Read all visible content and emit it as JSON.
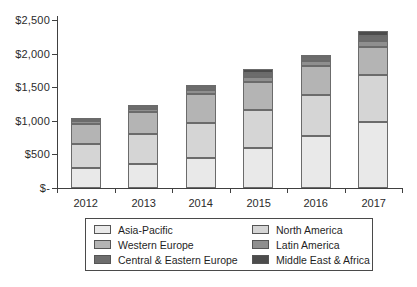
{
  "chart_data": {
    "type": "bar",
    "stacked": true,
    "title": "",
    "unit": "USD",
    "categories": [
      "2012",
      "2013",
      "2014",
      "2015",
      "2016",
      "2017"
    ],
    "series": [
      {
        "name": "Asia-Pacific",
        "color": "#e9e9e9",
        "values": [
          300,
          360,
          450,
          600,
          780,
          985
        ]
      },
      {
        "name": "North America",
        "color": "#d5d5d5",
        "values": [
          360,
          440,
          510,
          565,
          610,
          690
        ]
      },
      {
        "name": "Western Europe",
        "color": "#b4b4b4",
        "values": [
          290,
          330,
          440,
          405,
          430,
          420
        ]
      },
      {
        "name": "Latin America",
        "color": "#8f8f8f",
        "values": [
          40,
          45,
          55,
          75,
          75,
          90
        ]
      },
      {
        "name": "Central & Eastern Europe",
        "color": "#6d6d6d",
        "values": [
          30,
          40,
          45,
          70,
          55,
          80
        ]
      },
      {
        "name": "Middle East & Africa",
        "color": "#4c4c4c",
        "values": [
          20,
          25,
          30,
          50,
          35,
          65
        ]
      }
    ],
    "totals": [
      1040,
      1240,
      1530,
      1765,
      1985,
      2330
    ],
    "xlabel": "",
    "ylabel": "",
    "ylim": [
      0,
      2500
    ],
    "grid": false,
    "y_axis": {
      "tick_labels": [
        "$2,500",
        "$2,000",
        "$1,500",
        "$1,000",
        "$500",
        "$-"
      ],
      "tick_values": [
        2500,
        2000,
        1500,
        1000,
        500,
        0
      ]
    },
    "legend": {
      "position": "bottom",
      "columns": 2,
      "order": [
        "Asia-Pacific",
        "North America",
        "Western Europe",
        "Latin America",
        "Central & Eastern Europe",
        "Middle East & Africa"
      ]
    }
  }
}
